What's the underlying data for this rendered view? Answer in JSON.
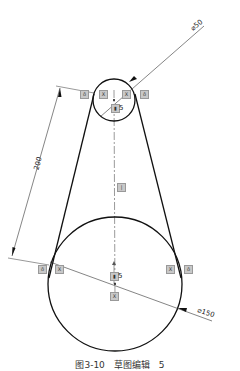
{
  "drawing": {
    "small_circle": {
      "cx": 114,
      "cy": 100,
      "r": 21,
      "diameter_label": "⌀50"
    },
    "large_circle": {
      "cx": 115,
      "cy": 284,
      "r": 67,
      "diameter_label": "⌀150"
    },
    "center_distance_label": "200",
    "fix_label_small": "5",
    "fix_label_large": "5",
    "line_color": "#111111",
    "icon_color": "#c8c8c8"
  },
  "relations": {
    "tangent_small_left": "ô",
    "coincident_small_left": "X",
    "coincident_small_right": "X",
    "tangent_small_right": "ô",
    "tangent_large_left": "ô",
    "coincident_large_left": "X",
    "coincident_large_right": "X",
    "tangent_large_right": "ô",
    "vertical_mid": "|",
    "fix_small": "▮",
    "fix_large": "▮",
    "coincident_large_bottom": "X"
  },
  "caption": "图3-10　草图编辑　5"
}
